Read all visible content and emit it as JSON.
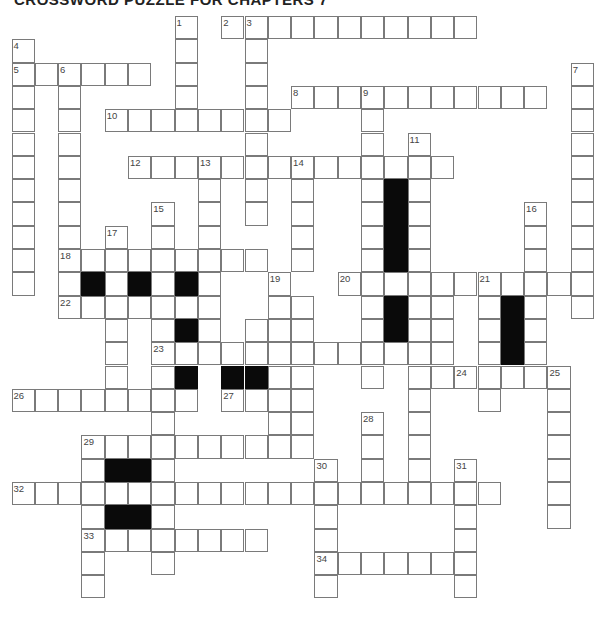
{
  "title": "CROSSWORD PUZZLE FOR CHAPTERS 7",
  "grid": {
    "cell_size": 23.3,
    "rows": 25,
    "cols": 25,
    "colors": {
      "border": "#7a7a7a",
      "black": "#0a0a0a",
      "number": "#444444",
      "background": "#ffffff"
    }
  },
  "words": [
    {
      "num": 2,
      "dir": "across",
      "row": 0,
      "col": 9,
      "len": 11
    },
    {
      "num": 1,
      "dir": "down",
      "row": 0,
      "col": 7,
      "len": 5
    },
    {
      "num": 3,
      "dir": "down",
      "row": 0,
      "col": 10,
      "len": 9
    },
    {
      "num": 4,
      "dir": "down",
      "row": 1,
      "col": 0,
      "len": 11
    },
    {
      "num": 5,
      "dir": "across",
      "row": 2,
      "col": 0,
      "len": 6
    },
    {
      "num": 6,
      "dir": "down",
      "row": 2,
      "col": 2,
      "len": 11
    },
    {
      "num": 7,
      "dir": "down",
      "row": 2,
      "col": 24,
      "len": 11
    },
    {
      "num": 8,
      "dir": "across",
      "row": 3,
      "col": 12,
      "len": 11
    },
    {
      "num": 9,
      "dir": "down",
      "row": 3,
      "col": 15,
      "len": 13
    },
    {
      "num": 10,
      "dir": "across",
      "row": 4,
      "col": 4,
      "len": 8
    },
    {
      "num": 11,
      "dir": "down",
      "row": 5,
      "col": 17,
      "len": 15
    },
    {
      "num": 12,
      "dir": "across",
      "row": 6,
      "col": 5,
      "len": 14
    },
    {
      "num": 13,
      "dir": "down",
      "row": 6,
      "col": 8,
      "len": 8
    },
    {
      "num": 14,
      "dir": "down",
      "row": 6,
      "col": 12,
      "len": 5
    },
    {
      "num": 15,
      "dir": "down",
      "row": 8,
      "col": 6,
      "len": 16
    },
    {
      "num": 16,
      "dir": "down",
      "row": 8,
      "col": 22,
      "len": 7
    },
    {
      "num": 17,
      "dir": "down",
      "row": 9,
      "col": 4,
      "len": 8
    },
    {
      "num": 18,
      "dir": "across",
      "row": 10,
      "col": 2,
      "len": 9
    },
    {
      "num": 19,
      "dir": "down",
      "row": 11,
      "col": 11,
      "len": 8
    },
    {
      "num": 20,
      "dir": "across",
      "row": 11,
      "col": 14,
      "len": 11
    },
    {
      "num": 21,
      "dir": "down",
      "row": 11,
      "col": 20,
      "len": 6
    },
    {
      "num": 22,
      "dir": "across",
      "row": 12,
      "col": 2,
      "len": 7
    },
    {
      "num": 23,
      "dir": "across",
      "row": 14,
      "col": 6,
      "len": 12
    },
    {
      "num": 24,
      "dir": "across",
      "row": 15,
      "col": 19,
      "len": 5
    },
    {
      "num": 25,
      "dir": "down",
      "row": 15,
      "col": 23,
      "len": 7
    },
    {
      "num": 26,
      "dir": "across",
      "row": 16,
      "col": 0,
      "len": 8
    },
    {
      "num": 27,
      "dir": "across",
      "row": 16,
      "col": 9,
      "len": 4
    },
    {
      "num": 28,
      "dir": "down",
      "row": 17,
      "col": 15,
      "len": 4
    },
    {
      "num": 29,
      "dir": "across",
      "row": 18,
      "col": 3,
      "len": 10
    },
    {
      "num": 29,
      "dir": "down",
      "row": 18,
      "col": 3,
      "len": 7
    },
    {
      "num": 30,
      "dir": "down",
      "row": 19,
      "col": 13,
      "len": 6
    },
    {
      "num": 31,
      "dir": "down",
      "row": 19,
      "col": 19,
      "len": 6
    },
    {
      "num": 32,
      "dir": "across",
      "row": 20,
      "col": 0,
      "len": 21
    },
    {
      "num": 33,
      "dir": "across",
      "row": 22,
      "col": 3,
      "len": 8
    },
    {
      "num": 34,
      "dir": "across",
      "row": 23,
      "col": 13,
      "len": 7
    }
  ],
  "extra_cells": [
    [
      12,
      12
    ],
    [
      13,
      12
    ],
    [
      14,
      12
    ],
    [
      15,
      12
    ],
    [
      16,
      12
    ],
    [
      17,
      12
    ],
    [
      18,
      12
    ],
    [
      11,
      8
    ],
    [
      12,
      8
    ],
    [
      13,
      8
    ],
    [
      14,
      8
    ],
    [
      13,
      10
    ],
    [
      14,
      10
    ],
    [
      15,
      10
    ],
    [
      16,
      10
    ],
    [
      17,
      17
    ],
    [
      18,
      17
    ],
    [
      19,
      17
    ],
    [
      16,
      11
    ],
    [
      17,
      11
    ],
    [
      18,
      11
    ],
    [
      21,
      6
    ],
    [
      22,
      6
    ],
    [
      23,
      6
    ],
    [
      12,
      18
    ],
    [
      13,
      18
    ],
    [
      14,
      18
    ],
    [
      15,
      18
    ],
    [
      12,
      16
    ],
    [
      13,
      16
    ],
    [
      14,
      16
    ],
    [
      11,
      16
    ],
    [
      7,
      16
    ],
    [
      8,
      16
    ],
    [
      9,
      16
    ],
    [
      10,
      16
    ],
    [
      12,
      21
    ],
    [
      13,
      21
    ],
    [
      14,
      21
    ]
  ],
  "black_cells": [
    [
      7,
      16
    ],
    [
      8,
      16
    ],
    [
      9,
      16
    ],
    [
      10,
      16
    ],
    [
      11,
      3
    ],
    [
      11,
      5
    ],
    [
      11,
      7
    ],
    [
      12,
      16
    ],
    [
      13,
      16
    ],
    [
      13,
      7
    ],
    [
      15,
      7
    ],
    [
      15,
      9
    ],
    [
      15,
      10
    ],
    [
      12,
      21
    ],
    [
      13,
      21
    ],
    [
      14,
      21
    ],
    [
      19,
      4
    ],
    [
      19,
      5
    ],
    [
      21,
      4
    ],
    [
      21,
      5
    ]
  ]
}
